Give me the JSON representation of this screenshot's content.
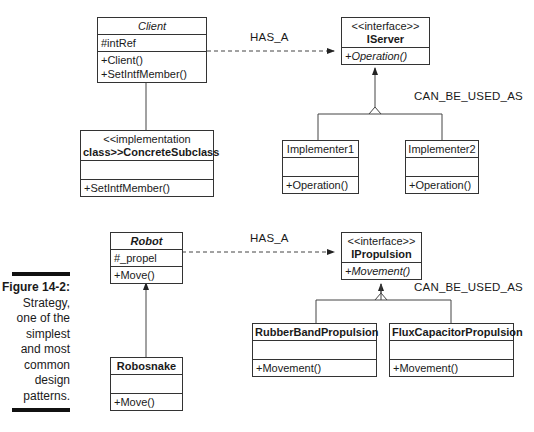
{
  "diagrams": [
    {
      "context": {
        "name": "Client",
        "name_style": "italic",
        "attributes": [
          "#intRef"
        ],
        "operations": [
          "+Client()",
          "+SetIntfMember()"
        ]
      },
      "association_label": "HAS_A",
      "interface": {
        "stereotype": "<<interface>>",
        "name": "IServer",
        "operations": [
          "+Operation()"
        ]
      },
      "realization_label": "CAN_BE_USED_AS",
      "subclass": {
        "stereotype_line1": "<<implementation",
        "stereotype_line2": "class>>ConcreteSubclass",
        "attributes": [],
        "operations": [
          "+SetIntfMember()"
        ]
      },
      "implementers": [
        {
          "name": "Implementer1",
          "operations": [
            "+Operation()"
          ]
        },
        {
          "name": "Implementer2",
          "operations": [
            "+Operation()"
          ]
        }
      ]
    },
    {
      "context": {
        "name": "Robot",
        "name_style": "bold-italic",
        "attributes": [
          "#_propel"
        ],
        "operations": [
          "+Move()"
        ]
      },
      "association_label": "HAS_A",
      "interface": {
        "stereotype": "<<interface>>",
        "name": "IPropulsion",
        "operations": [
          "+Movement()"
        ]
      },
      "realization_label": "CAN_BE_USED_AS",
      "subclass": {
        "name": "Robosnake",
        "attributes": [],
        "operations": [
          "+Move()"
        ]
      },
      "implementers": [
        {
          "name": "RubberBandPropulsion",
          "operations": [
            "+Movement()"
          ]
        },
        {
          "name": "FluxCapacitorPropulsion",
          "operations": [
            "+Movement()"
          ]
        }
      ]
    }
  ],
  "caption": {
    "label": "Figure 14-2:",
    "lines": [
      "Strategy,",
      "one of the",
      "simplest",
      "and most",
      "common",
      "design",
      "patterns."
    ]
  }
}
